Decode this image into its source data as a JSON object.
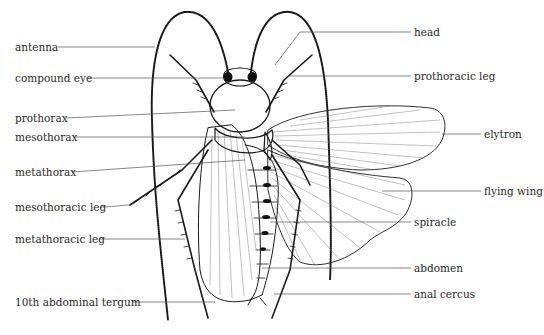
{
  "diagram": {
    "left_labels": [
      {
        "id": "antenna",
        "text": "antenna",
        "x": 15,
        "y": 41
      },
      {
        "id": "compound-eye",
        "text": "compound eye",
        "x": 15,
        "y": 72
      },
      {
        "id": "prothorax",
        "text": "prothorax",
        "x": 15,
        "y": 112
      },
      {
        "id": "mesothorax",
        "text": "mesothorax",
        "x": 15,
        "y": 131
      },
      {
        "id": "metathorax",
        "text": "metathorax",
        "x": 15,
        "y": 166
      },
      {
        "id": "mesothoracic-leg",
        "text": "mesothoracic leg",
        "x": 15,
        "y": 201
      },
      {
        "id": "metathoracic-leg",
        "text": "metathoracic leg",
        "x": 15,
        "y": 233
      },
      {
        "id": "10th-abdominal-tergum",
        "text": "10th abdominal tergum",
        "x": 15,
        "y": 296
      }
    ],
    "right_labels": [
      {
        "id": "head",
        "text": "head",
        "x": 414,
        "y": 26
      },
      {
        "id": "prothoracic-leg",
        "text": "prothoracic leg",
        "x": 414,
        "y": 70
      },
      {
        "id": "elytron",
        "text": "elytron",
        "x": 484,
        "y": 128
      },
      {
        "id": "flying-wing",
        "text": "flying wing",
        "x": 484,
        "y": 185
      },
      {
        "id": "spiracle",
        "text": "spiracle",
        "x": 414,
        "y": 216
      },
      {
        "id": "abdomen",
        "text": "abdomen",
        "x": 414,
        "y": 262
      },
      {
        "id": "anal-cercus",
        "text": "anal cercus",
        "x": 414,
        "y": 288
      }
    ],
    "colors": {
      "ink": "#1a1a1a",
      "leader": "#555555",
      "text": "#2a2a2a",
      "background": "#ffffff"
    }
  }
}
